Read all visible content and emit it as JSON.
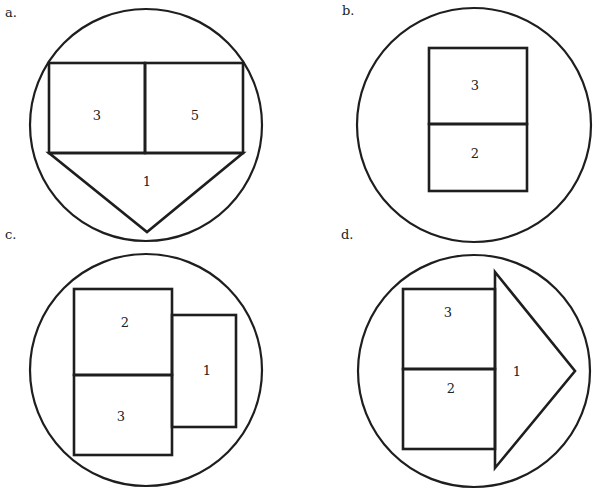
{
  "panels": [
    {
      "label": "a.",
      "description": "Circle containing a rectangle split into two cells with a downward triangle below",
      "regions": [
        {
          "id": "left-cell",
          "value": "3"
        },
        {
          "id": "right-cell",
          "value": "5"
        },
        {
          "id": "triangle",
          "value": "1"
        }
      ]
    },
    {
      "label": "b.",
      "description": "Circle containing two vertically stacked boxes",
      "regions": [
        {
          "id": "top-cell",
          "value": "3"
        },
        {
          "id": "bottom-cell",
          "value": "2"
        }
      ]
    },
    {
      "label": "c.",
      "description": "Circle containing two stacked boxes with a smaller box attached on the right",
      "regions": [
        {
          "id": "top-cell",
          "value": "2"
        },
        {
          "id": "bottom-cell",
          "value": "3"
        },
        {
          "id": "side-box",
          "value": "1"
        }
      ]
    },
    {
      "label": "d.",
      "description": "Circle containing two stacked boxes with a right-pointing triangle attached",
      "regions": [
        {
          "id": "top-cell",
          "value": "3"
        },
        {
          "id": "bottom-cell",
          "value": "2"
        },
        {
          "id": "arrow-triangle",
          "value": "1"
        }
      ]
    }
  ]
}
